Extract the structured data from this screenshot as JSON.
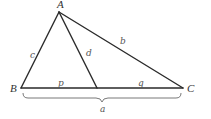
{
  "diagram": {
    "type": "triangle-with-cevian",
    "vertices": {
      "A": {
        "label": "A",
        "x": 59,
        "y": 12
      },
      "B": {
        "label": "B",
        "x": 21,
        "y": 88
      },
      "C": {
        "label": "C",
        "x": 183,
        "y": 88
      },
      "D": {
        "label": "",
        "x": 97,
        "y": 88
      }
    },
    "segments": [
      {
        "name": "side-c",
        "from": "A",
        "to": "B",
        "label": "c"
      },
      {
        "name": "side-b",
        "from": "A",
        "to": "C",
        "label": "b"
      },
      {
        "name": "cevian-d",
        "from": "A",
        "to": "D",
        "label": "d"
      },
      {
        "name": "segment-p",
        "from": "B",
        "to": "D",
        "label": "p"
      },
      {
        "name": "segment-q",
        "from": "D",
        "to": "C",
        "label": "q"
      }
    ],
    "brace": {
      "from": "B",
      "to": "C",
      "label": "a"
    },
    "labels": {
      "A": "A",
      "B": "B",
      "C": "C",
      "a": "a",
      "b": "b",
      "c": "c",
      "d": "d",
      "p": "p",
      "q": "q"
    },
    "colors": {
      "line": "#2a2a2a",
      "brace": "#6a6a6a",
      "text": "#555555",
      "background": "#ffffff"
    }
  }
}
